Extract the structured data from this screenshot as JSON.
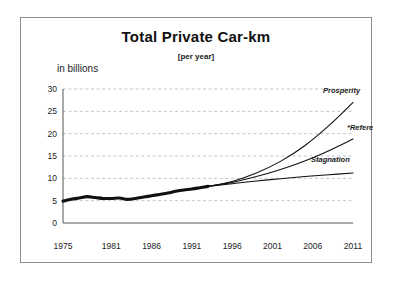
{
  "chart_data": {
    "type": "line",
    "title": "Total Private Car-km",
    "subtitle": "[per year]",
    "ylabel": "in billions",
    "xlabel": "",
    "ylim": [
      0,
      30
    ],
    "xlim": [
      1975,
      2011
    ],
    "yticks": [
      0,
      5,
      10,
      15,
      20,
      25,
      30
    ],
    "ytick_labels": [
      "0",
      "5",
      "10",
      "15",
      "20",
      "25",
      "30"
    ],
    "xticks": [
      1975,
      1981,
      1986,
      1991,
      1996,
      2001,
      2006,
      2011
    ],
    "xtick_labels": [
      "1975",
      "1981",
      "1986",
      "1991",
      "1996",
      "2001",
      "2006",
      "2011"
    ],
    "grid": true,
    "legend_position": "inline-right-of-line-ends",
    "series": [
      {
        "name": "Historical",
        "label": "",
        "style": "thick-solid",
        "x": [
          1975,
          1976,
          1977,
          1978,
          1979,
          1980,
          1981,
          1982,
          1983,
          1984,
          1985,
          1986,
          1987,
          1988,
          1989,
          1990,
          1991,
          1992,
          1993
        ],
        "values": [
          4.9,
          5.3,
          5.6,
          5.9,
          5.7,
          5.5,
          5.5,
          5.6,
          5.3,
          5.5,
          5.8,
          6.1,
          6.4,
          6.7,
          7.1,
          7.4,
          7.6,
          7.9,
          8.2
        ]
      },
      {
        "name": "Prosperity",
        "label": "Prosperity",
        "style": "thin-solid",
        "x": [
          1993,
          1996,
          1999,
          2002,
          2005,
          2008,
          2011
        ],
        "values": [
          8.2,
          9.3,
          11.2,
          13.8,
          17.3,
          21.8,
          27.0
        ]
      },
      {
        "name": "Reference",
        "label": "*Reference",
        "style": "thin-solid",
        "x": [
          1993,
          1996,
          1999,
          2002,
          2005,
          2008,
          2011
        ],
        "values": [
          8.2,
          9.1,
          10.4,
          12.0,
          13.9,
          16.2,
          18.8
        ]
      },
      {
        "name": "Stagnation",
        "label": "Stagnation",
        "style": "thin-solid",
        "x": [
          1993,
          1996,
          1999,
          2002,
          2005,
          2008,
          2011
        ],
        "values": [
          8.2,
          8.8,
          9.4,
          9.9,
          10.4,
          10.8,
          11.2
        ]
      }
    ]
  },
  "colors": {
    "line": "#111111",
    "grid": "#a9a9c0",
    "axis": "#555555",
    "frame": "#8d8d8d",
    "background": "#ffffff"
  }
}
